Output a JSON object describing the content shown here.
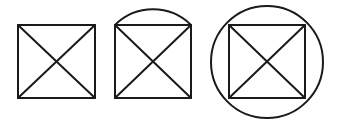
{
  "diagram": {
    "stroke_color": "#1a1a1a",
    "background": "#ffffff",
    "figures": [
      {
        "name": "square-with-diagonals",
        "square": {
          "x": 18,
          "y": 25,
          "w": 77,
          "h": 73
        }
      },
      {
        "name": "square-with-diagonals-and-arc",
        "square": {
          "x": 115,
          "y": 25,
          "w": 76,
          "h": 73
        },
        "arc_top_y": 7
      },
      {
        "name": "square-with-diagonals-in-circle",
        "square": {
          "x": 229,
          "y": 25,
          "w": 76,
          "h": 73
        },
        "circle": {
          "cx": 267,
          "cy": 62,
          "r": 56
        }
      }
    ]
  }
}
